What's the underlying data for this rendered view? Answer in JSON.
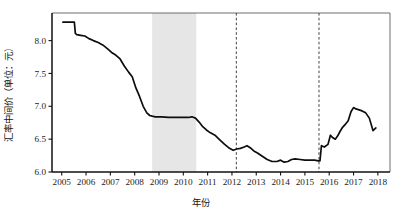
{
  "chart_data": {
    "type": "line",
    "title": "",
    "xlabel": "年份",
    "ylabel": "汇率中间价（单位：元）",
    "xlim": [
      2004.6,
      2018.5
    ],
    "ylim": [
      6.0,
      8.42
    ],
    "grid": false,
    "legend": null,
    "y_ticks": [
      "6.0",
      "6.5",
      "7.0",
      "7.5",
      "8.0"
    ],
    "y_tick_values": [
      6.0,
      6.5,
      7.0,
      7.5,
      8.0
    ],
    "x_ticks": [
      "2005",
      "2006",
      "2007",
      "2008",
      "2009",
      "2010",
      "2011",
      "2012",
      "2013",
      "2014",
      "2015",
      "2016",
      "2017",
      "2018"
    ],
    "x_tick_values": [
      2005,
      2006,
      2007,
      2008,
      2009,
      2010,
      2011,
      2012,
      2013,
      2014,
      2015,
      2016,
      2017,
      2018
    ],
    "series": [
      {
        "name": "人民币兑美元汇率中间价",
        "x": [
          2005.05,
          2005.3,
          2005.52,
          2005.56,
          2005.62,
          2005.78,
          2005.95,
          2006.12,
          2006.3,
          2006.5,
          2006.7,
          2006.9,
          2007.05,
          2007.22,
          2007.4,
          2007.58,
          2007.75,
          2007.9,
          2008.05,
          2008.2,
          2008.35,
          2008.5,
          2008.62,
          2008.72,
          2008.85,
          2009.1,
          2009.4,
          2009.7,
          2010.0,
          2010.2,
          2010.35,
          2010.5,
          2010.65,
          2010.8,
          2010.95,
          2011.1,
          2011.3,
          2011.5,
          2011.7,
          2011.9,
          2012.05,
          2012.2,
          2012.35,
          2012.5,
          2012.62,
          2012.75,
          2012.9,
          2013.05,
          2013.25,
          2013.45,
          2013.65,
          2013.85,
          2014.0,
          2014.15,
          2014.3,
          2014.45,
          2014.6,
          2014.8,
          2015.0,
          2015.2,
          2015.4,
          2015.55,
          2015.62,
          2015.68,
          2015.8,
          2015.95,
          2016.05,
          2016.15,
          2016.25,
          2016.35,
          2016.45,
          2016.55,
          2016.65,
          2016.78,
          2016.9,
          2017.0,
          2017.1,
          2017.2,
          2017.35,
          2017.5,
          2017.65,
          2017.8,
          2017.92
        ],
        "y": [
          8.28,
          8.28,
          8.28,
          8.11,
          8.09,
          8.08,
          8.07,
          8.03,
          8.0,
          7.97,
          7.93,
          7.87,
          7.82,
          7.78,
          7.72,
          7.61,
          7.52,
          7.45,
          7.28,
          7.15,
          7.0,
          6.9,
          6.86,
          6.85,
          6.84,
          6.84,
          6.83,
          6.83,
          6.83,
          6.83,
          6.84,
          6.82,
          6.76,
          6.69,
          6.64,
          6.6,
          6.56,
          6.49,
          6.42,
          6.36,
          6.33,
          6.35,
          6.36,
          6.38,
          6.4,
          6.37,
          6.32,
          6.29,
          6.24,
          6.19,
          6.16,
          6.16,
          6.18,
          6.15,
          6.16,
          6.19,
          6.2,
          6.19,
          6.18,
          6.18,
          6.18,
          6.17,
          6.17,
          6.4,
          6.38,
          6.42,
          6.56,
          6.52,
          6.5,
          6.55,
          6.62,
          6.68,
          6.72,
          6.78,
          6.92,
          6.98,
          6.96,
          6.95,
          6.93,
          6.9,
          6.82,
          6.63,
          6.67
        ],
        "color": "#0d0d0d"
      }
    ],
    "annotations": {
      "shaded_bands": [
        {
          "name": "peg-period-band",
          "x_start": 2008.72,
          "x_end": 2010.53,
          "color": "#e6e6e6",
          "label": ""
        }
      ],
      "event_lines": [
        {
          "name": "event-line-2012",
          "x": 2012.18,
          "style": "dashed",
          "label": ""
        },
        {
          "name": "event-line-2015",
          "x": 2015.58,
          "style": "dashed",
          "label": ""
        }
      ]
    }
  },
  "figure": {
    "background_color": "#ffffff",
    "line_color": "#0d0d0d",
    "band_color": "#e6e6e6",
    "axis_color": "#111111"
  }
}
